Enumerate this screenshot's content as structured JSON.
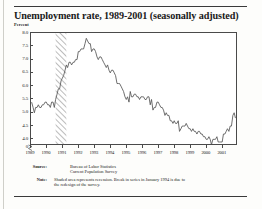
{
  "figure": {
    "title": "Unemployment rate, 1989-2001 (seasonally adjusted)",
    "y_axis_label": "Percent"
  },
  "footnotes": {
    "source_label": "Source:",
    "source_line1": "Bureau of Labor Statistics",
    "source_line2": "Current Population Survey",
    "note_label": "Note:",
    "note_line1": "Shaded area represents recession. Break in series in January 1994 is due to",
    "note_line2": "the redesign of the survey."
  },
  "chart_data": {
    "type": "line",
    "title": "Unemployment rate, 1989-2001 (seasonally adjusted)",
    "xlabel": "",
    "ylabel": "Percent",
    "xlim": [
      1989.0,
      2001.95
    ],
    "ylim": [
      3.75,
      8.0
    ],
    "grid": false,
    "legend": null,
    "y_ticks": [
      "8.0",
      "7.5",
      "7.0",
      "6.5",
      "6.0",
      "5.5",
      "5.0",
      "4.5",
      "4.0",
      "0"
    ],
    "y_tick_values": [
      8.0,
      7.5,
      7.0,
      6.5,
      6.0,
      5.5,
      5.0,
      4.5,
      4.0,
      0
    ],
    "y_axis_break": true,
    "x_ticks": [
      "1989",
      "1990",
      "1991",
      "1992",
      "1993",
      "1994",
      "1995",
      "1996",
      "1997",
      "1998",
      "1999",
      "2000",
      "2001"
    ],
    "x_tick_values": [
      1989,
      1990,
      1991,
      1992,
      1993,
      1994,
      1995,
      1996,
      1997,
      1998,
      1999,
      2000,
      2001
    ],
    "shaded_regions": [
      {
        "label": "recession",
        "x0": 1990.54,
        "x1": 1991.21,
        "style": "diagonal-hatch"
      }
    ],
    "series": [
      {
        "name": "Unemployment rate",
        "color": "#555555",
        "x": [
          1989.04,
          1989.13,
          1989.21,
          1989.29,
          1989.38,
          1989.46,
          1989.54,
          1989.63,
          1989.71,
          1989.79,
          1989.88,
          1989.96,
          1990.04,
          1990.13,
          1990.21,
          1990.29,
          1990.38,
          1990.46,
          1990.54,
          1990.63,
          1990.71,
          1990.79,
          1990.88,
          1990.96,
          1991.04,
          1991.13,
          1991.21,
          1991.29,
          1991.38,
          1991.46,
          1991.54,
          1991.63,
          1991.71,
          1991.79,
          1991.88,
          1991.96,
          1992.04,
          1992.13,
          1992.21,
          1992.29,
          1992.38,
          1992.46,
          1992.54,
          1992.63,
          1992.71,
          1992.79,
          1992.88,
          1992.96,
          1993.04,
          1993.13,
          1993.21,
          1993.29,
          1993.38,
          1993.46,
          1993.54,
          1993.63,
          1993.71,
          1993.79,
          1993.88,
          1993.96,
          1994.04,
          1994.13,
          1994.21,
          1994.29,
          1994.38,
          1994.46,
          1994.54,
          1994.63,
          1994.71,
          1994.79,
          1994.88,
          1994.96,
          1995.04,
          1995.13,
          1995.21,
          1995.29,
          1995.38,
          1995.46,
          1995.54,
          1995.63,
          1995.71,
          1995.79,
          1995.88,
          1995.96,
          1996.04,
          1996.13,
          1996.21,
          1996.29,
          1996.38,
          1996.46,
          1996.54,
          1996.63,
          1996.71,
          1996.79,
          1996.88,
          1996.96,
          1997.04,
          1997.13,
          1997.21,
          1997.29,
          1997.38,
          1997.46,
          1997.54,
          1997.63,
          1997.71,
          1997.79,
          1997.88,
          1997.96,
          1998.04,
          1998.13,
          1998.21,
          1998.29,
          1998.38,
          1998.46,
          1998.54,
          1998.63,
          1998.71,
          1998.79,
          1998.88,
          1998.96,
          1999.04,
          1999.13,
          1999.21,
          1999.29,
          1999.38,
          1999.46,
          1999.54,
          1999.63,
          1999.71,
          1999.79,
          1999.88,
          1999.96,
          2000.04,
          2000.13,
          2000.21,
          2000.29,
          2000.38,
          2000.46,
          2000.54,
          2000.63,
          2000.71,
          2000.79,
          2000.88,
          2000.96,
          2001.04,
          2001.13,
          2001.21,
          2001.29,
          2001.38,
          2001.46,
          2001.54,
          2001.63,
          2001.71,
          2001.79
        ],
        "y": [
          5.4,
          5.2,
          5.0,
          5.2,
          5.2,
          5.3,
          5.2,
          5.2,
          5.3,
          5.3,
          5.4,
          5.4,
          5.3,
          5.3,
          5.2,
          5.4,
          5.4,
          5.2,
          5.5,
          5.7,
          5.9,
          5.9,
          6.2,
          6.3,
          6.4,
          6.6,
          6.8,
          6.7,
          6.9,
          6.9,
          6.8,
          6.9,
          6.9,
          7.0,
          7.0,
          7.3,
          7.3,
          7.4,
          7.4,
          7.4,
          7.6,
          7.8,
          7.7,
          7.6,
          7.6,
          7.3,
          7.4,
          7.4,
          7.3,
          7.1,
          7.0,
          7.1,
          7.1,
          7.0,
          6.9,
          6.8,
          6.7,
          6.8,
          6.6,
          6.5,
          6.6,
          6.6,
          6.5,
          6.4,
          6.1,
          6.1,
          6.1,
          6.0,
          5.9,
          5.8,
          5.6,
          5.5,
          5.6,
          5.4,
          5.8,
          5.6,
          5.6,
          5.7,
          5.7,
          5.6,
          5.6,
          5.5,
          5.6,
          5.6,
          5.6,
          5.5,
          5.5,
          5.6,
          5.6,
          5.3,
          5.5,
          5.1,
          5.2,
          5.2,
          5.4,
          5.4,
          5.3,
          5.2,
          5.2,
          5.1,
          4.9,
          5.0,
          4.9,
          4.9,
          4.7,
          4.7,
          4.6,
          4.7,
          4.6,
          4.6,
          4.7,
          4.3,
          4.4,
          4.5,
          4.5,
          4.5,
          4.6,
          4.5,
          4.4,
          4.4,
          4.3,
          4.4,
          4.3,
          4.3,
          4.2,
          4.3,
          4.3,
          4.2,
          4.2,
          4.1,
          4.1,
          4.0,
          4.0,
          4.1,
          4.0,
          3.8,
          4.0,
          4.0,
          4.0,
          4.1,
          3.9,
          3.9,
          3.9,
          3.9,
          4.2,
          4.2,
          4.3,
          4.4,
          4.3,
          4.5,
          4.5,
          4.9,
          5.0,
          4.8
        ]
      }
    ]
  }
}
